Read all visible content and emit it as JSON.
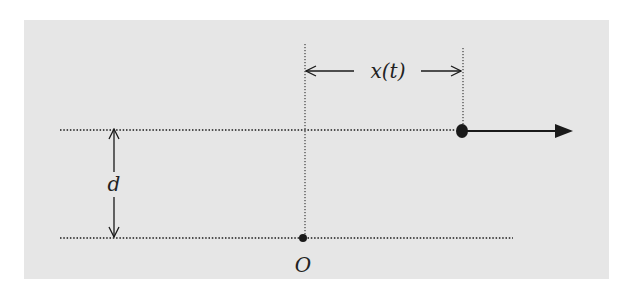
{
  "diagram": {
    "labels": {
      "displacement": "x(t)",
      "separation": "d",
      "origin": "O"
    },
    "colors": {
      "background": "#e6e6e6",
      "ink": "#1a1a1a"
    },
    "elements": {
      "top_line": "dotted horizontal line along which the particle moves",
      "bottom_line": "dotted horizontal reference line containing origin O",
      "particle": "filled dot moving right along top line",
      "velocity_arrow": "solid arrow pointing right from particle",
      "origin_point": "small filled dot at O on bottom line"
    }
  }
}
